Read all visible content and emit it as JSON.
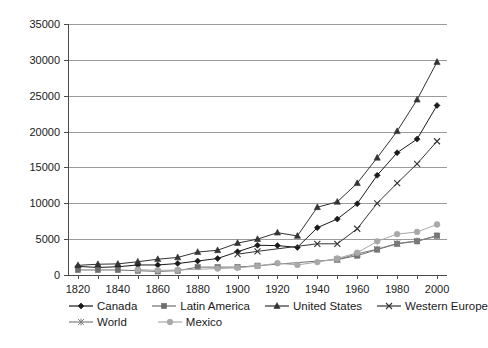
{
  "chart_data": {
    "type": "line",
    "title": "",
    "xlabel": "",
    "ylabel": "GDP in 1990 $",
    "xlim": [
      1815,
      2005
    ],
    "ylim": [
      0,
      35000
    ],
    "grid": true,
    "legend_position": "bottom",
    "y_ticks": [
      "0",
      "5000",
      "10000",
      "15000",
      "20000",
      "25000",
      "30000",
      "35000"
    ],
    "y_tick_values": [
      0,
      5000,
      10000,
      15000,
      20000,
      25000,
      30000,
      35000
    ],
    "x_ticks": [
      "1820",
      "1840",
      "1860",
      "1880",
      "1900",
      "1920",
      "1940",
      "1960",
      "1980",
      "2000"
    ],
    "x_tick_values": [
      1820,
      1840,
      1860,
      1880,
      1900,
      1920,
      1940,
      1960,
      1980,
      2000
    ],
    "series": [
      {
        "name": "Canada",
        "marker": "diamond",
        "color": "#1a1a1a",
        "x": [
          1820,
          1830,
          1840,
          1850,
          1860,
          1870,
          1880,
          1890,
          1900,
          1910,
          1920,
          1930,
          1940,
          1950,
          1960,
          1970,
          1980,
          1990,
          2000
        ],
        "y": [
          1200,
          1050,
          1150,
          1400,
          1400,
          1600,
          1950,
          2300,
          3250,
          4150,
          4100,
          3850,
          6600,
          7800,
          9950,
          13900,
          17050,
          18950,
          23650
        ]
      },
      {
        "name": "Latin America",
        "marker": "square",
        "color": "#6e6e6e",
        "x": [
          1820,
          1830,
          1840,
          1850,
          1860,
          1870,
          1880,
          1890,
          1900,
          1910,
          1950,
          1960,
          1970,
          1980,
          1990,
          2000
        ],
        "y": [
          700,
          700,
          700,
          600,
          500,
          600,
          1100,
          1100,
          1100,
          1300,
          2150,
          2700,
          3550,
          4350,
          4700,
          5500
        ]
      },
      {
        "name": "United States",
        "marker": "triangle",
        "color": "#333333",
        "x": [
          1820,
          1830,
          1840,
          1850,
          1860,
          1870,
          1880,
          1890,
          1900,
          1910,
          1920,
          1930,
          1940,
          1950,
          1960,
          1970,
          1980,
          1990,
          2000
        ],
        "y": [
          1350,
          1500,
          1550,
          1850,
          2200,
          2450,
          3200,
          3450,
          4450,
          5000,
          5900,
          5450,
          9450,
          10200,
          12800,
          16350,
          20050,
          24450,
          29700
        ]
      },
      {
        "name": "Western Europe",
        "marker": "cross",
        "color": "#333333",
        "x": [
          1900,
          1910,
          1940,
          1950,
          1960,
          1970,
          1980,
          1990,
          2000
        ],
        "y": [
          2900,
          3300,
          4350,
          4350,
          6450,
          10000,
          12800,
          15500,
          18650
        ]
      },
      {
        "name": "World",
        "marker": "asterisk",
        "color": "#7d7d7d",
        "x": [
          1950,
          1960,
          1970,
          1980,
          1990,
          2000
        ],
        "y": [
          2150,
          2950,
          3600,
          4400,
          4750,
          5400
        ]
      },
      {
        "name": "Mexico",
        "marker": "circle",
        "color": "#a8a8a8",
        "x": [
          1850,
          1860,
          1870,
          1890,
          1900,
          1910,
          1920,
          1930,
          1940,
          1950,
          1960,
          1970,
          1980,
          1990,
          2000
        ],
        "y": [
          750,
          650,
          700,
          900,
          1000,
          1250,
          1650,
          1400,
          1800,
          2300,
          3100,
          4700,
          5700,
          6000,
          7050
        ]
      }
    ]
  },
  "legend": {
    "row1": [
      {
        "label": "Canada",
        "marker": "diamond",
        "color": "#1a1a1a"
      },
      {
        "label": "Latin America",
        "marker": "square",
        "color": "#6e6e6e"
      },
      {
        "label": "United States",
        "marker": "triangle",
        "color": "#333333"
      },
      {
        "label": "Western Europe",
        "marker": "cross",
        "color": "#333333"
      }
    ],
    "row2": [
      {
        "label": "World",
        "marker": "asterisk",
        "color": "#7d7d7d"
      },
      {
        "label": "Mexico",
        "marker": "circle",
        "color": "#a8a8a8"
      }
    ]
  },
  "colors": {
    "grid": "#9b9b9b",
    "axis": "#4a4a4a",
    "background": "#ffffff",
    "text": "#1a1a1a"
  }
}
